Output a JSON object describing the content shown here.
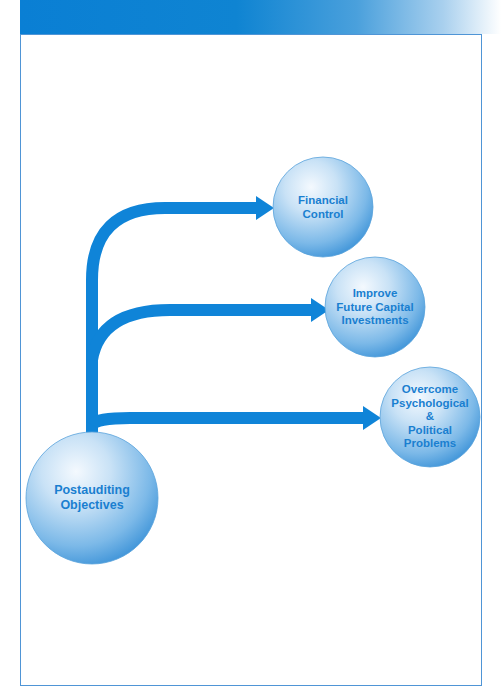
{
  "colors": {
    "accent": "#0f84d8",
    "arrow": "#0f84d8",
    "frame_border": "#4f95d6",
    "label_text": "#1a7fd0",
    "circle_light": "#eef6fd",
    "circle_dark": "#4d9fdc"
  },
  "diagram": {
    "root": {
      "label": "Postauditing\nObjectives",
      "cx": 92,
      "cy": 498,
      "r": 66
    },
    "objectives": [
      {
        "label": "Financial\nControl",
        "cx": 323,
        "cy": 207,
        "r": 50
      },
      {
        "label": "Improve\nFuture Capital\nInvestments",
        "cx": 375,
        "cy": 307,
        "r": 50
      },
      {
        "label": "Overcome\nPsychological &\nPolitical\nProblems",
        "cx": 430,
        "cy": 417,
        "r": 50
      }
    ],
    "arrows": [
      {
        "target": "Financial Control",
        "y": 208,
        "tip_x": 273
      },
      {
        "target": "Improve Future Capital Investments",
        "y": 310,
        "tip_x": 328
      },
      {
        "target": "Overcome Psychological & Political Problems",
        "y": 418,
        "tip_x": 380
      }
    ]
  }
}
